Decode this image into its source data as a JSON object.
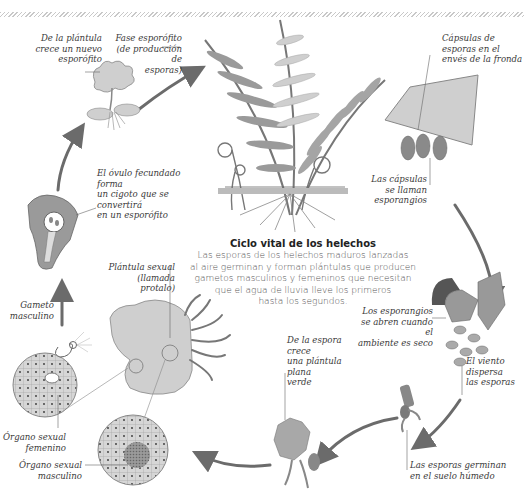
{
  "diagram": {
    "title": "Ciclo vital de los helechos",
    "description": "Las esporas de los helechos maduros lanzadas\nal aire germinan y forman plántulas que producen\ngametos masculinos y femeninos que necesitan\nque el agua de lluvia lleve los primeros\nhasta los segundos.",
    "colors": {
      "arrow": "#6b6b6b",
      "frond_dark": "#8a8a8a",
      "frond_light": "#cfcfcf",
      "tissue": "#bdbdbd",
      "cell_dark": "#7d7d7d",
      "text": "#3a3a3a"
    },
    "labels": {
      "new_sporophyte": "De la plántula\ncrece un nuevo\nesporófito",
      "sporophyte_phase": "Fase esporófito\n(de producción de\nesporas)",
      "spore_capsules": "Cápsulas de\nesporas en el\nenvés de la fronda",
      "zygote": "El óvulo fecundado forma\nun cigoto que se convertirá\nen un esporófito",
      "sporangia_name": "Las cápsulas\nse llaman\nesporangios",
      "male_gamete": "Gameto\nmasculino",
      "prothallus": "Plántula sexual\n(llamada protalo)",
      "sporangia_open": "Los esporangios\nse abren cuando el\nambiente es seco",
      "wind": "El viento\ndispersa\nlas esporas",
      "female_organ": "Órgano sexual\nfemenino",
      "male_organ": "Órgano sexual\nmasculino",
      "green_plantlet": "De la espora crece\nuna plántula plana\nverde",
      "germinate": "Las esporas germinan\nen el suelo húmedo"
    },
    "stages": [
      "fern-sporophyte",
      "frond-underside-capsules",
      "open-sporangia-spores",
      "germinating-spore",
      "flat-green-plantlet",
      "prothallus-sex-organs",
      "male-gamete",
      "zygote",
      "young-sporophyte"
    ]
  }
}
